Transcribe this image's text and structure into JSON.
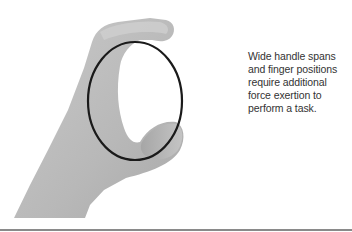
{
  "figure": {
    "caption": "Wide handle spans and finger positions require additional force exertion to perform a task.",
    "illustration": "hand-pinch-grip-with-highlight-circle",
    "colors": {
      "background": "#ffffff",
      "skin": "#bdbdbd",
      "skin_shadow": "#a8a8a8",
      "skin_highlight": "#d0d0d0",
      "circle_stroke": "#1a1a1a",
      "caption_text": "#333333",
      "bottom_rule": "#8a8a8a"
    }
  }
}
